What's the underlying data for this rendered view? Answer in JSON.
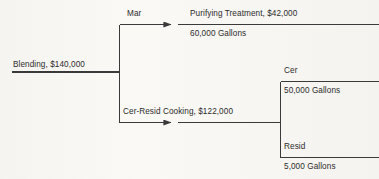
{
  "diagram": {
    "line_color": "#3a3a3a",
    "text_color": "#2b2b2b",
    "background_color": "#f6f4f0",
    "nodes": {
      "input": {
        "label": "Blending, $140,000"
      },
      "branch_top": {
        "split_label": "Mar",
        "process_label": "Purifying Treatment, $42,000",
        "quantity_label": "60,000 Gallons"
      },
      "branch_bottom": {
        "process_label": "Cer-Resid Cooking, $122,000",
        "outputs": [
          {
            "label": "Cer",
            "quantity_label": "50,000 Gallons"
          },
          {
            "label": "Resid",
            "quantity_label": "5,000 Gallons"
          }
        ]
      }
    }
  }
}
